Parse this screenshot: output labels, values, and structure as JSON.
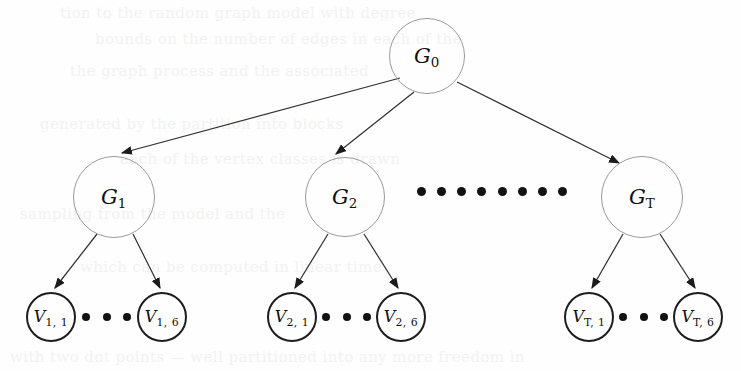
{
  "figure": {
    "background_color": "#fefefe",
    "stroke_color_group": "#9a9a9a",
    "stroke_color_vertex": "#1d1d1d",
    "edge_color": "#333333",
    "dot_color": "#121212",
    "bleed_text_color": "#f2f2f2"
  },
  "nodes": {
    "root": {
      "id": "G0",
      "label_base": "G",
      "label_sub": "0",
      "cx": 427,
      "cy": 56,
      "r": 38,
      "kind": "group"
    },
    "groups": [
      {
        "id": "G1",
        "label_base": "G",
        "label_sub": "1",
        "cx": 114,
        "cy": 197,
        "r": 41,
        "kind": "group"
      },
      {
        "id": "G2",
        "label_base": "G",
        "label_sub": "2",
        "cx": 345,
        "cy": 197,
        "r": 40,
        "kind": "group"
      },
      {
        "id": "GT",
        "label_base": "G",
        "label_sub": "T",
        "cx": 642,
        "cy": 197,
        "r": 41,
        "kind": "group"
      }
    ],
    "leaves": [
      {
        "id": "V1_1",
        "label_base": "V",
        "label_sub": "1, 1",
        "cx": 51,
        "cy": 317,
        "r": 25,
        "kind": "vertex"
      },
      {
        "id": "V1_6",
        "label_base": "V",
        "label_sub": "1, 6",
        "cx": 162,
        "cy": 317,
        "r": 25,
        "kind": "vertex"
      },
      {
        "id": "V2_1",
        "label_base": "V",
        "label_sub": "2, 1",
        "cx": 292,
        "cy": 317,
        "r": 25,
        "kind": "vertex"
      },
      {
        "id": "V2_6",
        "label_base": "V",
        "label_sub": "2, 6",
        "cx": 401,
        "cy": 317,
        "r": 25,
        "kind": "vertex"
      },
      {
        "id": "VT_1",
        "label_base": "V",
        "label_sub": "T, 1",
        "cx": 589,
        "cy": 317,
        "r": 25,
        "kind": "vertex"
      },
      {
        "id": "VT_6",
        "label_base": "V",
        "label_sub": "T, 6",
        "cx": 698,
        "cy": 317,
        "r": 25,
        "kind": "vertex"
      }
    ]
  },
  "edges": [
    {
      "id": "e-root-g1",
      "from": "G0",
      "to": "G1",
      "x1": 400,
      "y1": 78,
      "x2": 122,
      "y2": 153,
      "arrow": true
    },
    {
      "id": "e-root-g2",
      "from": "G0",
      "to": "G2",
      "x1": 414,
      "y1": 92,
      "x2": 336,
      "y2": 154,
      "arrow": true
    },
    {
      "id": "e-root-gt",
      "from": "G0",
      "to": "GT",
      "x1": 457,
      "y1": 82,
      "x2": 619,
      "y2": 163,
      "arrow": true
    },
    {
      "id": "e-g1-v11",
      "from": "G1",
      "to": "V1_1",
      "x1": 97,
      "y1": 234,
      "x2": 55,
      "y2": 288,
      "arrow": true
    },
    {
      "id": "e-g1-v16",
      "from": "G1",
      "to": "V1_6",
      "x1": 133,
      "y1": 234,
      "x2": 160,
      "y2": 288,
      "arrow": true
    },
    {
      "id": "e-g2-v21",
      "from": "G2",
      "to": "V2_1",
      "x1": 328,
      "y1": 234,
      "x2": 295,
      "y2": 288,
      "arrow": true
    },
    {
      "id": "e-g2-v26",
      "from": "G2",
      "to": "V2_6",
      "x1": 364,
      "y1": 234,
      "x2": 398,
      "y2": 288,
      "arrow": true
    },
    {
      "id": "e-gt-vt1",
      "from": "GT",
      "to": "VT_1",
      "x1": 623,
      "y1": 234,
      "x2": 592,
      "y2": 288,
      "arrow": true
    },
    {
      "id": "e-gt-vt6",
      "from": "GT",
      "to": "VT_6",
      "x1": 660,
      "y1": 234,
      "x2": 695,
      "y2": 288,
      "arrow": true
    }
  ],
  "dot_rows": [
    {
      "id": "ellipsis-groups",
      "kind": "middle",
      "count": 8,
      "left": 417,
      "top": 186,
      "width": 150,
      "height": 10
    },
    {
      "id": "ellipsis-leaves-1",
      "kind": "leaf",
      "count": 3,
      "left": 82,
      "top": 313,
      "width": 49,
      "height": 8
    },
    {
      "id": "ellipsis-leaves-2",
      "kind": "leaf",
      "count": 3,
      "left": 322,
      "top": 313,
      "width": 49,
      "height": 8
    },
    {
      "id": "ellipsis-leaves-T",
      "kind": "leaf",
      "count": 3,
      "left": 619,
      "top": 313,
      "width": 49,
      "height": 8
    }
  ],
  "bleed_through_lines": [
    {
      "text": "tion to the random graph model with degree",
      "left": 60,
      "top": 4,
      "size": 15
    },
    {
      "text": "bounds on the number of edges in each of the",
      "left": 95,
      "top": 30,
      "size": 15
    },
    {
      "text": "the graph process and the associated",
      "left": 70,
      "top": 62,
      "size": 15
    },
    {
      "text": "generated by the partition into blocks",
      "left": 40,
      "top": 115,
      "size": 15
    },
    {
      "text": "each of the vertex classes is drawn",
      "left": 120,
      "top": 150,
      "size": 15
    },
    {
      "text": "sampling from the model and the",
      "left": 20,
      "top": 205,
      "size": 15
    },
    {
      "text": "which can be computed in linear time",
      "left": 80,
      "top": 258,
      "size": 15
    },
    {
      "text": "with two dot points — well partitioned into any more freedom in",
      "left": 10,
      "top": 348,
      "size": 15
    }
  ]
}
